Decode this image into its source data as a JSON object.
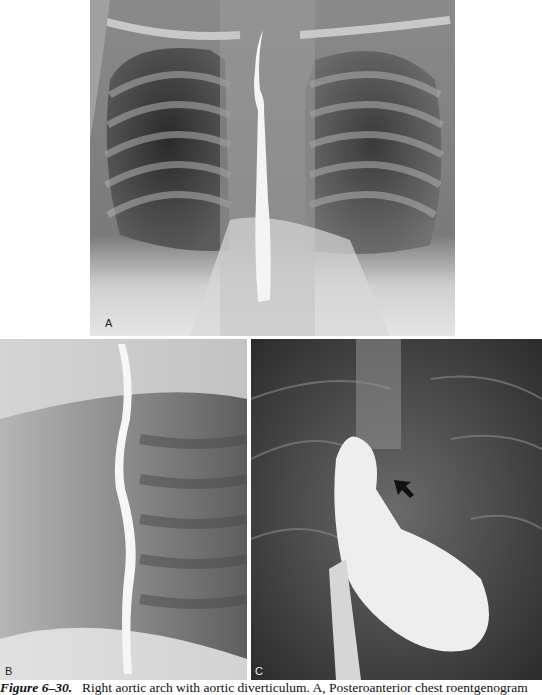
{
  "figure": {
    "panels": [
      {
        "id": "A",
        "label": "A",
        "description": "Posteroanterior chest roentgenogram with barium-filled esophagus"
      },
      {
        "id": "B",
        "label": "B",
        "description": "Lateral view with barium-filled esophagus"
      },
      {
        "id": "C",
        "label": "C",
        "description": "Angiogram with arrow indicating aortic diverticulum"
      }
    ],
    "caption": {
      "number": "Figure 6–30.",
      "text": "Right aortic arch with aortic diverticulum. A, Posteroanterior chest roentgenogram"
    }
  }
}
